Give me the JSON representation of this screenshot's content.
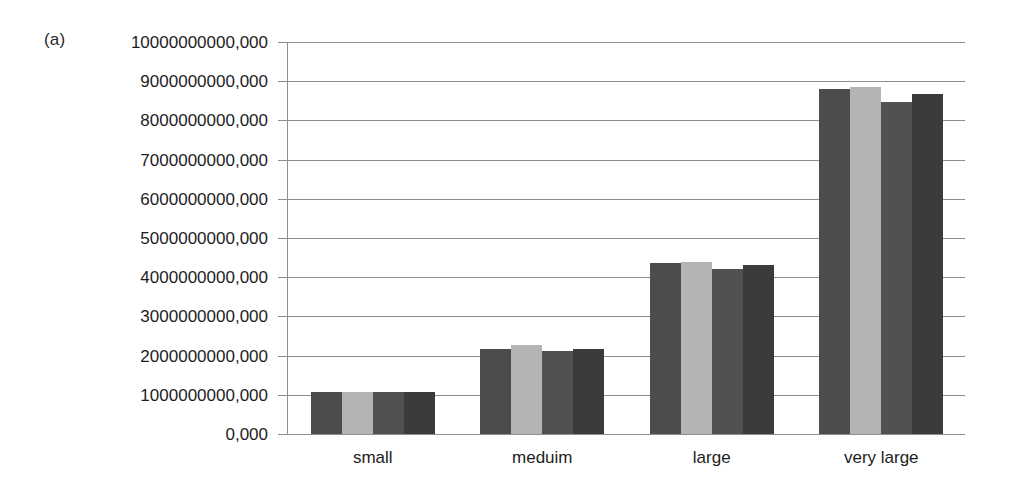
{
  "panel": {
    "label": "(a)"
  },
  "chart_data": {
    "type": "bar",
    "title": "",
    "xlabel": "",
    "ylabel": "",
    "categories": [
      "small",
      "meduim",
      "large",
      "very large"
    ],
    "ylim": [
      0,
      10000000000
    ],
    "ytick_values": [
      0,
      1000000000,
      2000000000,
      3000000000,
      4000000000,
      5000000000,
      6000000000,
      7000000000,
      8000000000,
      9000000000,
      10000000000
    ],
    "ytick_labels": [
      "0,000",
      "1000000000,000",
      "2000000000,000",
      "3000000000,000",
      "4000000000,000",
      "5000000000,000",
      "6000000000,000",
      "7000000000,000",
      "8000000000,000",
      "9000000000,000",
      "10000000000,000"
    ],
    "grid": true,
    "legend": "none",
    "series": [
      {
        "name": "series-1",
        "color": "#4c4c4c",
        "values": [
          1080000000,
          2180000000,
          4370000000,
          8790000000
        ]
      },
      {
        "name": "series-2",
        "color": "#b4b4b4",
        "values": [
          1080000000,
          2270000000,
          4400000000,
          8840000000
        ]
      },
      {
        "name": "series-3",
        "color": "#515151",
        "values": [
          1070000000,
          2130000000,
          4220000000,
          8470000000
        ]
      },
      {
        "name": "series-4",
        "color": "#3b3b3b",
        "values": [
          1070000000,
          2160000000,
          4310000000,
          8680000000
        ]
      }
    ]
  },
  "colors": {
    "background": "#ffffff",
    "gridline": "#8e8e8e",
    "text": "#1d1d1d"
  }
}
